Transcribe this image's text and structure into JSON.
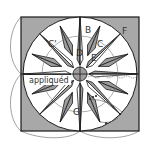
{
  "diagram": {
    "type": "quilt-block-diagram",
    "colors": {
      "background": "#a8a8a8",
      "outline": "#1a1a1a",
      "white_piece": "#ffffff",
      "gray_piece": "#9c9c9c",
      "guide_line": "#777777"
    },
    "labels": {
      "B": "B",
      "C_prime": "C'",
      "C": "C",
      "D": "D",
      "E": "E",
      "F": "F",
      "G": "G",
      "appliqued": "appliquéd"
    }
  }
}
